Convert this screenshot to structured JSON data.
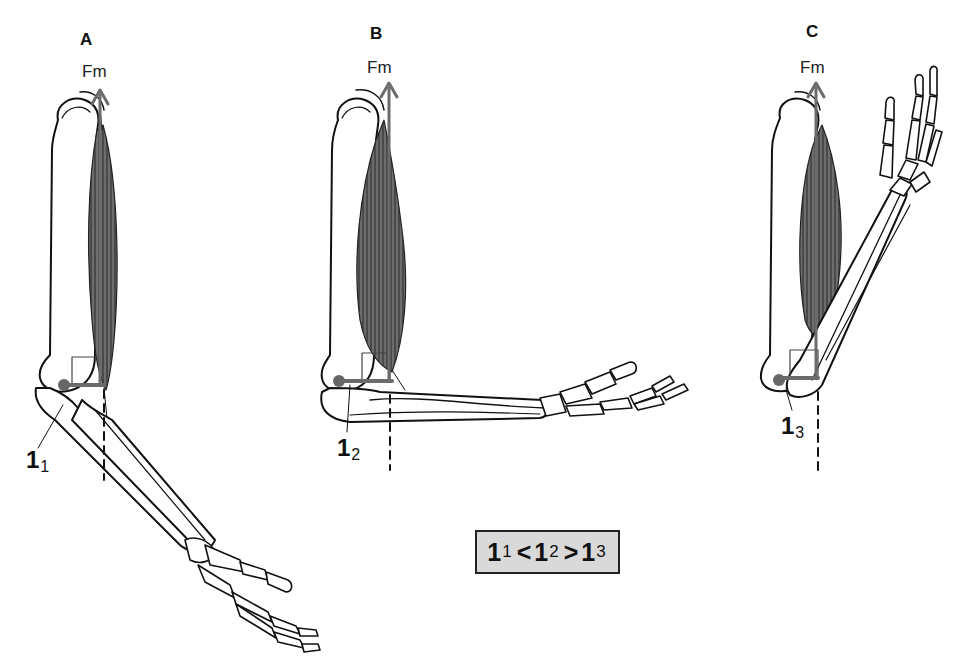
{
  "figure": {
    "type": "anatomical-diagram",
    "colors": {
      "outline": "#111111",
      "muscle": "#3a3a3a",
      "force_arrow": "#6b6b6b",
      "joint_dot": "#666666",
      "formula_box_bg": "#d9d9d9"
    }
  },
  "panels": [
    {
      "id": "A",
      "label": "A",
      "force_label": "Fm",
      "lever": {
        "symbol": "1",
        "subscript": "1"
      },
      "elbow_angle": "extended"
    },
    {
      "id": "B",
      "label": "B",
      "force_label": "Fm",
      "lever": {
        "symbol": "1",
        "subscript": "2"
      },
      "elbow_angle": "90 degrees"
    },
    {
      "id": "C",
      "label": "C",
      "force_label": "Fm",
      "lever": {
        "symbol": "1",
        "subscript": "3"
      },
      "elbow_angle": "flexed"
    }
  ],
  "formula": {
    "parts": [
      {
        "base": "1",
        "sub": "1"
      },
      {
        "op": "<"
      },
      {
        "base": "1",
        "sub": "2"
      },
      {
        "op": ">"
      },
      {
        "base": "1",
        "sub": "3"
      }
    ],
    "text": "1₁ < 1₂ > 1₃"
  }
}
